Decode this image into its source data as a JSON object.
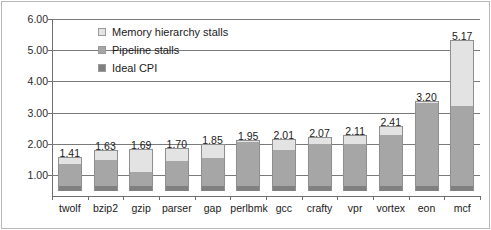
{
  "chart_data": {
    "type": "bar",
    "subtype": "stacked-bar",
    "title": "",
    "subtitle": "",
    "xlabel": "",
    "ylabel": "",
    "ylim": [
      0.33,
      6.0
    ],
    "y_ticks": [
      "1.00",
      "2.00",
      "3.00",
      "4.00",
      "5.00",
      "6.00"
    ],
    "y_tick_values": [
      1.0,
      2.0,
      3.0,
      4.0,
      5.0,
      6.0
    ],
    "grid": true,
    "grid_axis": "y",
    "legend_position": "upper-left-inside",
    "categories": [
      "twolf",
      "bzip2",
      "gzip",
      "parser",
      "gap",
      "perlbmk",
      "gcc",
      "crafty",
      "vpr",
      "vortex",
      "eon",
      "mcf"
    ],
    "totals": [
      1.41,
      1.63,
      1.69,
      1.7,
      1.85,
      1.95,
      2.01,
      2.07,
      2.11,
      2.41,
      3.2,
      5.17
    ],
    "data_labels": [
      "1.41",
      "1.63",
      "1.69",
      "1.70",
      "1.85",
      "1.95",
      "2.01",
      "2.07",
      "2.11",
      "2.41",
      "3.20",
      "5.17"
    ],
    "series": [
      {
        "name": "Ideal CPI",
        "color": "#808080",
        "stack_order": 0,
        "values": [
          0.5,
          0.5,
          0.5,
          0.5,
          0.5,
          0.5,
          0.5,
          0.5,
          0.5,
          0.5,
          0.5,
          0.5
        ],
        "cumulative_tops": [
          0.5,
          0.5,
          0.5,
          0.5,
          0.5,
          0.5,
          0.5,
          0.5,
          0.5,
          0.5,
          0.5,
          0.5
        ]
      },
      {
        "name": "Pipeline stalls",
        "color": "#a6a6a6",
        "stack_order": 1,
        "values": [
          0.7,
          0.82,
          0.45,
          0.78,
          0.88,
          1.4,
          1.15,
          1.35,
          1.33,
          1.62,
          2.65,
          2.55
        ],
        "cumulative_tops": [
          1.2,
          1.32,
          0.95,
          1.28,
          1.38,
          1.9,
          1.65,
          1.85,
          1.83,
          2.12,
          3.15,
          3.05
        ]
      },
      {
        "name": "Memory hierarchy stalls",
        "color": "#e3e3e3",
        "stack_order": 2,
        "values": [
          0.21,
          0.31,
          0.74,
          0.42,
          0.47,
          0.05,
          0.36,
          0.22,
          0.28,
          0.29,
          0.05,
          2.12
        ],
        "cumulative_tops": [
          1.41,
          1.63,
          1.69,
          1.7,
          1.85,
          1.95,
          2.01,
          2.07,
          2.11,
          2.41,
          3.2,
          5.17
        ]
      }
    ]
  },
  "legend": {
    "items": [
      {
        "label": "Memory hierarchy stalls",
        "color": "#e3e3e3"
      },
      {
        "label": "Pipeline stalls",
        "color": "#a6a6a6"
      },
      {
        "label": "Ideal CPI",
        "color": "#808080"
      }
    ]
  }
}
